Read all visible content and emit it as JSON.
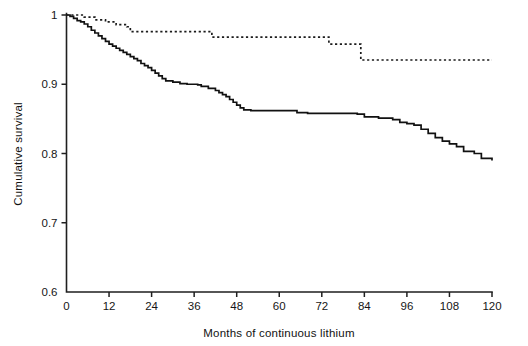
{
  "chart_data": {
    "type": "line",
    "title": "",
    "subtitle": "",
    "xlabel": "Months of continuous lithium",
    "ylabel": "Cumulative survival",
    "xlim": [
      0,
      120
    ],
    "ylim": [
      0.6,
      1.0
    ],
    "xticks": [
      0,
      12,
      24,
      36,
      48,
      60,
      72,
      84,
      96,
      108,
      120
    ],
    "xticklabels": [
      "0",
      "12",
      "24",
      "36",
      "48",
      "60",
      "72",
      "84",
      "96",
      "108",
      "120"
    ],
    "yticks": [
      0.6,
      0.7,
      0.8,
      0.9,
      1.0
    ],
    "yticklabels": [
      "0.6",
      "0.7",
      "0.8",
      "0.9",
      "1"
    ],
    "grid": false,
    "legend": "none",
    "plot_style": "kaplan-meier step curves",
    "series": [
      {
        "name": "solid-curve",
        "style": "solid",
        "color": "#111111",
        "description": "Lower step-down Kaplan-Meier survival curve",
        "x": [
          0,
          1,
          2,
          3,
          4,
          5,
          6,
          7,
          8,
          9,
          10,
          11,
          12,
          13,
          14,
          15,
          16,
          17,
          18,
          19,
          20,
          21,
          22,
          23,
          24,
          25,
          26,
          27,
          28,
          30,
          32,
          34,
          36,
          37,
          38,
          40,
          42,
          43,
          44,
          45,
          46,
          47,
          48,
          49,
          50,
          52,
          55,
          60,
          64,
          65,
          68,
          72,
          78,
          82,
          84,
          88,
          92,
          94,
          96,
          98,
          100,
          102,
          104,
          106,
          108,
          110,
          112,
          115,
          117,
          120
        ],
        "y": [
          1.0,
          0.998,
          0.995,
          0.992,
          0.99,
          0.987,
          0.983,
          0.978,
          0.974,
          0.97,
          0.966,
          0.962,
          0.958,
          0.955,
          0.952,
          0.949,
          0.946,
          0.943,
          0.94,
          0.937,
          0.934,
          0.93,
          0.927,
          0.924,
          0.92,
          0.916,
          0.912,
          0.908,
          0.905,
          0.903,
          0.901,
          0.9,
          0.9,
          0.899,
          0.897,
          0.894,
          0.891,
          0.888,
          0.885,
          0.882,
          0.878,
          0.874,
          0.87,
          0.866,
          0.863,
          0.862,
          0.862,
          0.862,
          0.862,
          0.859,
          0.858,
          0.858,
          0.858,
          0.857,
          0.853,
          0.851,
          0.849,
          0.845,
          0.843,
          0.841,
          0.835,
          0.829,
          0.823,
          0.818,
          0.814,
          0.81,
          0.803,
          0.8,
          0.793,
          0.79
        ]
      },
      {
        "name": "dotted-curve",
        "style": "dotted",
        "color": "#1b1b1b",
        "description": "Upper dotted Kaplan-Meier survival curve",
        "x": [
          0,
          3,
          5,
          8,
          11,
          14,
          17,
          18,
          40,
          41,
          73,
          74,
          82,
          83,
          120
        ],
        "y": [
          1.0,
          1.0,
          0.997,
          0.993,
          0.99,
          0.986,
          0.983,
          0.976,
          0.976,
          0.968,
          0.968,
          0.958,
          0.958,
          0.935,
          0.935
        ]
      }
    ]
  },
  "figure": {
    "background": "#ffffff",
    "ink": "#111111"
  }
}
